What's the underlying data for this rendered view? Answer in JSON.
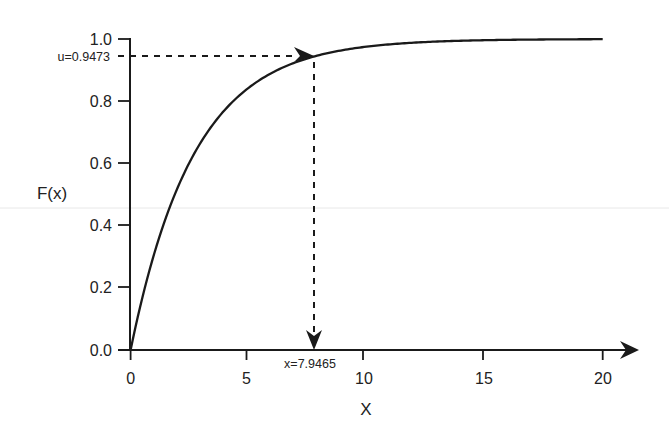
{
  "chart_data": {
    "type": "line",
    "title": "",
    "xlabel": "X",
    "ylabel": "F(x)",
    "xlim": [
      0,
      20
    ],
    "ylim": [
      0,
      1.0
    ],
    "x_ticks": [
      0,
      5,
      10,
      15,
      20
    ],
    "x_tick_labels": [
      "0",
      "5",
      "10",
      "15",
      "20"
    ],
    "y_ticks": [
      0.0,
      0.2,
      0.4,
      0.6,
      0.8,
      1.0
    ],
    "y_tick_labels": [
      "0.0",
      "0.2",
      "0.4",
      "0.6",
      "0.8",
      "1.0"
    ],
    "grid": false,
    "legend": null,
    "series": [
      {
        "name": "F(x) = 1 - exp(-lambda x)",
        "function": "exponential_cdf",
        "lambda": 0.3704,
        "x": [
          0,
          1,
          2,
          3,
          4,
          5,
          6,
          7,
          7.9465,
          9,
          10,
          12,
          14,
          16,
          18,
          20
        ],
        "y": [
          0.0,
          0.31,
          0.523,
          0.671,
          0.773,
          0.843,
          0.892,
          0.925,
          0.9473,
          0.964,
          0.975,
          0.988,
          0.994,
          0.997,
          0.999,
          0.999
        ]
      }
    ],
    "annotations": [
      {
        "text": "u=0.9473",
        "type": "horizontal-dashed-arrow",
        "from": [
          0,
          0.9473
        ],
        "to": [
          7.9465,
          0.9473
        ]
      },
      {
        "text": "x=7.9465",
        "type": "vertical-dashed-arrow",
        "from": [
          7.9465,
          0.9473
        ],
        "to": [
          7.9465,
          0.0
        ]
      }
    ]
  },
  "labels": {
    "ylabel": "F(x)",
    "xlabel": "X",
    "u_annotation": "u=0.9473",
    "x_annotation": "x=7.9465",
    "x_ticks": [
      "0",
      "5",
      "10",
      "15",
      "20"
    ],
    "y_ticks": [
      "0.0",
      "0.2",
      "0.4",
      "0.6",
      "0.8",
      "1.0"
    ]
  }
}
